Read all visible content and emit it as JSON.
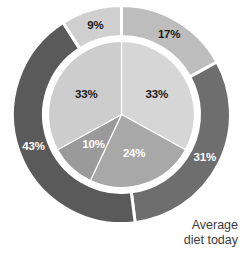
{
  "caption": {
    "line1": "Average",
    "line2": "diet today"
  },
  "colors": {
    "background": "#ffffff",
    "separator": "#ffffff",
    "outer_17": "#bdbdbd",
    "outer_31": "#6e6e6e",
    "outer_43": "#5a5a5a",
    "outer_9": "#cfcfcf",
    "inner_33_right": "#d6d6d6",
    "inner_24": "#a8a8a8",
    "inner_10": "#9a9a9a",
    "inner_33_left": "#cdcdcd",
    "label_dark": "#1a1a1a",
    "label_light": "#ffffff",
    "caption_text": "#3b3b3b"
  },
  "chart_data": {
    "type": "pie",
    "title": "Average diet today",
    "xlabel": "",
    "ylabel": "",
    "legend_position": "none",
    "grid": false,
    "rings": [
      {
        "name": "outer",
        "radius_outer": 109,
        "radius_inner": 78,
        "start_angle_deg": 0,
        "slices": [
          {
            "label": "17%",
            "value": 17,
            "color": "#bdbdbd",
            "label_color": "#1a1a1a"
          },
          {
            "label": "31%",
            "value": 31,
            "color": "#6e6e6e",
            "label_color": "#ffffff"
          },
          {
            "label": "43%",
            "value": 43,
            "color": "#5a5a5a",
            "label_color": "#ffffff"
          },
          {
            "label": "9%",
            "value": 9,
            "color": "#cfcfcf",
            "label_color": "#1a1a1a"
          }
        ]
      },
      {
        "name": "inner",
        "radius_outer": 73,
        "radius_inner": 0,
        "start_angle_deg": 0,
        "slices": [
          {
            "label": "33%",
            "value": 33,
            "color": "#d6d6d6",
            "label_color": "#1a1a1a"
          },
          {
            "label": "24%",
            "value": 24,
            "color": "#a8a8a8",
            "label_color": "#ffffff"
          },
          {
            "label": "10%",
            "value": 10,
            "color": "#9a9a9a",
            "label_color": "#ffffff"
          },
          {
            "label": "33%",
            "value": 33,
            "color": "#cdcdcd",
            "label_color": "#1a1a1a"
          }
        ]
      }
    ],
    "labels_outer": [
      "17%",
      "31%",
      "43%",
      "9%"
    ],
    "values_outer": [
      17,
      31,
      43,
      9
    ],
    "labels_inner": [
      "33%",
      "24%",
      "10%",
      "33%"
    ],
    "values_inner": [
      33,
      24,
      10,
      33
    ]
  }
}
